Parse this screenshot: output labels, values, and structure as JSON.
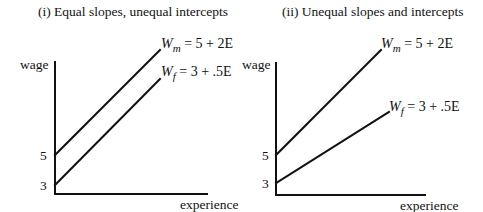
{
  "panels": [
    {
      "title": "(i) Equal slopes, unequal intercepts",
      "y_axis_label": "wage",
      "x_axis_label": "experience",
      "y_ticks": [
        "5",
        "3"
      ],
      "lines": [
        {
          "name": "male",
          "var": "W",
          "sub": "m",
          "equation": "= 5 + 2E",
          "intercept": 5,
          "slope": 2
        },
        {
          "name": "female",
          "var": "W",
          "sub": "f",
          "equation": "= 3 + .5E",
          "intercept": 3,
          "slope": 0.5
        }
      ]
    },
    {
      "title": "(ii) Unequal slopes and intercepts",
      "y_axis_label": "wage",
      "x_axis_label": "experience",
      "y_ticks": [
        "5",
        "3"
      ],
      "lines": [
        {
          "name": "male",
          "var": "W",
          "sub": "m",
          "equation": "= 5 + 2E",
          "intercept": 5,
          "slope": 2
        },
        {
          "name": "female",
          "var": "W",
          "sub": "f",
          "equation": "= 3 + .5E",
          "intercept": 3,
          "slope": 0.5
        }
      ]
    }
  ],
  "colors": {
    "ink": "#111111",
    "background": "#ffffff"
  }
}
